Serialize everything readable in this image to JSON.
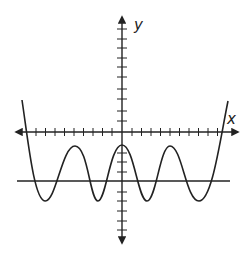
{
  "diagram": {
    "type": "function-graph",
    "axes": {
      "x_label": "x",
      "y_label": "y",
      "x_ticks_each_side": 11,
      "y_ticks_up": 10,
      "y_ticks_down": 9
    },
    "curve": {
      "description": "polynomial-like oscillating curve with 3 local maxima and 4 local minima, rising steeply at both ends",
      "local_maxima_count": 3,
      "local_minima_count": 4
    },
    "horizontal_line": {
      "description": "horizontal line below the x-axis intersecting the curve 8 times"
    },
    "colors": {
      "stroke": "#222222",
      "background": "#ffffff"
    }
  }
}
